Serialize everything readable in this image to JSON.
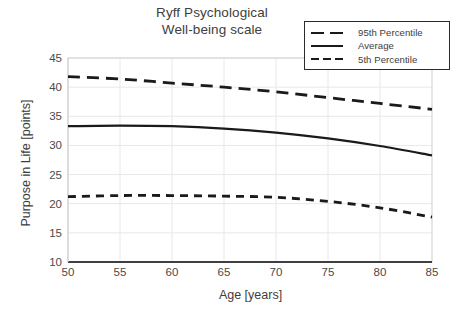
{
  "title": {
    "line1": "Ryff Psychological",
    "line2": "Well-being scale"
  },
  "legend": {
    "position": "top-right",
    "items": [
      {
        "label": "95th Percentile",
        "style": "dashed-long"
      },
      {
        "label": "Average",
        "style": "solid"
      },
      {
        "label": "5th Percentile",
        "style": "dashed-short"
      }
    ]
  },
  "axes": {
    "x_label": "Age [years]",
    "y_label": "Purpose in Life [points]",
    "x_ticks": [
      "50",
      "55",
      "60",
      "65",
      "70",
      "75",
      "80",
      "85"
    ],
    "y_ticks": [
      "45",
      "40",
      "35",
      "30",
      "25",
      "20",
      "15",
      "10"
    ]
  },
  "colors": {
    "line": "#1a1a1a",
    "grid": "#e8e8e8",
    "border": "#d6d6d6",
    "axis": "#3f3f3f",
    "text": "#3d3d3d",
    "background": "#ffffff"
  },
  "chart_data": {
    "type": "line",
    "title": "Ryff Psychological Well-being scale",
    "xlabel": "Age [years]",
    "ylabel": "Purpose in Life [points]",
    "xlim": [
      50,
      85
    ],
    "ylim": [
      10,
      45
    ],
    "xticks": [
      50,
      55,
      60,
      65,
      70,
      75,
      80,
      85
    ],
    "yticks": [
      10,
      15,
      20,
      25,
      30,
      35,
      40,
      45
    ],
    "grid": true,
    "legend_position": "upper right",
    "x": [
      50,
      55,
      60,
      65,
      70,
      75,
      80,
      85
    ],
    "series": [
      {
        "name": "95th Percentile",
        "style": "dashed-long",
        "values": [
          41.8,
          41.4,
          40.7,
          40.0,
          39.2,
          38.2,
          37.2,
          36.2
        ]
      },
      {
        "name": "Average",
        "style": "solid",
        "values": [
          33.3,
          33.4,
          33.3,
          32.9,
          32.2,
          31.2,
          29.9,
          28.3
        ]
      },
      {
        "name": "5th Percentile",
        "style": "dashed-short",
        "values": [
          21.2,
          21.4,
          21.4,
          21.3,
          21.1,
          20.4,
          19.3,
          17.7
        ]
      }
    ]
  }
}
